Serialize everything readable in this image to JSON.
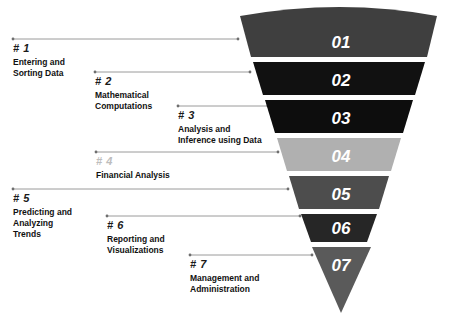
{
  "diagram": {
    "funnel": {
      "bands": [
        {
          "number": "01",
          "color": "#3f3f3f",
          "label_color": "#ffffff"
        },
        {
          "number": "02",
          "color": "#111111",
          "label_color": "#ffffff"
        },
        {
          "number": "03",
          "color": "#0d0d0d",
          "label_color": "#ffffff"
        },
        {
          "number": "04",
          "color": "#b0b0b0",
          "label_color": "#ffffff"
        },
        {
          "number": "05",
          "color": "#4d4d4d",
          "label_color": "#ffffff"
        },
        {
          "number": "06",
          "color": "#262626",
          "label_color": "#ffffff"
        },
        {
          "number": "07",
          "color": "#5a5a5a",
          "label_color": "#ffffff"
        }
      ]
    },
    "steps": [
      {
        "number": "# 1",
        "number_muted": false,
        "lines": [
          "Entering and",
          "Sorting Data"
        ]
      },
      {
        "number": "# 2",
        "number_muted": false,
        "lines": [
          "Mathematical",
          "Computations"
        ]
      },
      {
        "number": "# 3",
        "number_muted": false,
        "lines": [
          "Analysis and",
          "Inference using Data"
        ]
      },
      {
        "number": "# 4",
        "number_muted": true,
        "lines": [
          "Financial Analysis"
        ]
      },
      {
        "number": "# 5",
        "number_muted": false,
        "lines": [
          "Predicting and",
          "Analyzing",
          "Trends"
        ]
      },
      {
        "number": "# 6",
        "number_muted": false,
        "lines": [
          "Reporting and",
          "Visualizations"
        ]
      },
      {
        "number": "# 7",
        "number_muted": false,
        "lines": [
          "Management and",
          "Administration"
        ]
      }
    ],
    "colors": {
      "background": "#ffffff",
      "connector": "#9a9a9a",
      "text": "#111111",
      "muted_text": "#bdbdbd"
    }
  }
}
